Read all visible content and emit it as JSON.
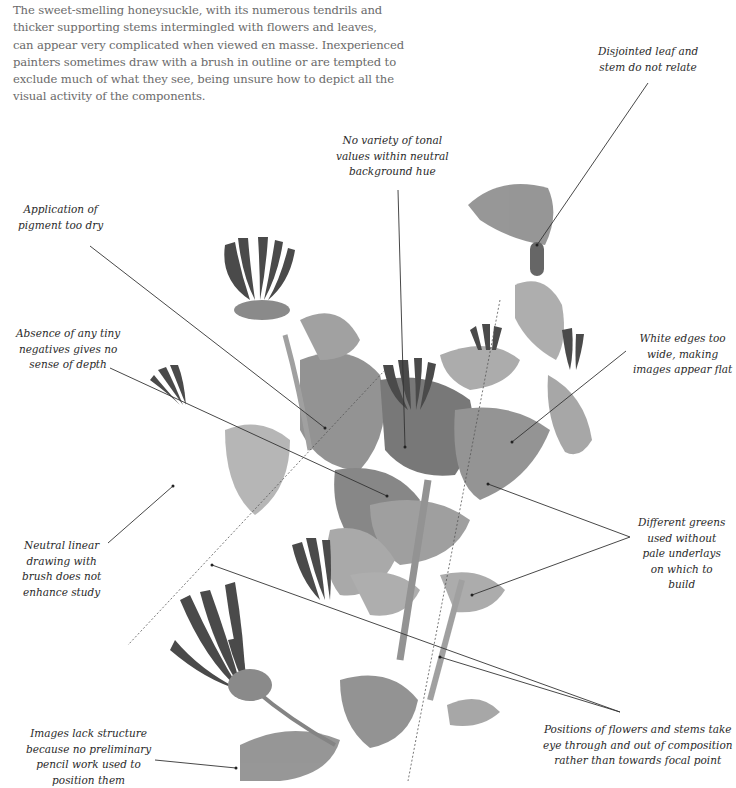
{
  "intro": {
    "lines": [
      "The sweet-smelling honeysuckle, with its numerous tendrils and",
      "thicker supporting stems intermingled with flowers and leaves,",
      "can appear very complicated when viewed en masse. Inexperienced",
      "painters sometimes draw with a brush in outline or are tempted to",
      "exclude much of what they see, being unsure how to depict all the",
      "visual activity of the components."
    ]
  },
  "illustration": {
    "subject": "honeysuckle-watercolor-study",
    "palette": {
      "dark": "#3c3c3c",
      "mid": "#6e6e6e",
      "light": "#9a9a9a",
      "pale": "#bdbdbd",
      "leader": "#333333"
    }
  },
  "annotations": [
    {
      "id": "disjointed",
      "lines": [
        "Disjointed leaf and",
        "stem do not relate"
      ]
    },
    {
      "id": "tonal",
      "lines": [
        "No variety of tonal",
        "values within neutral",
        "background hue"
      ]
    },
    {
      "id": "dry",
      "lines": [
        "Application of",
        "pigment too dry"
      ]
    },
    {
      "id": "negatives",
      "lines": [
        "Absence of any tiny",
        "negatives gives no",
        "sense of depth"
      ]
    },
    {
      "id": "white-edges",
      "lines": [
        "White edges too",
        "wide, making",
        "images appear flat"
      ]
    },
    {
      "id": "linear",
      "lines": [
        "Neutral linear",
        "drawing with",
        "brush does not",
        "enhance study"
      ]
    },
    {
      "id": "greens",
      "lines": [
        "Different greens",
        "used without",
        "pale underlays",
        "on which to",
        "build"
      ]
    },
    {
      "id": "structure",
      "lines": [
        "Images lack structure",
        "because no preliminary",
        "pencil work used to",
        "position them"
      ]
    },
    {
      "id": "positions",
      "lines": [
        "Positions of flowers and stems take",
        "eye through and out of composition",
        "rather than towards focal point"
      ]
    }
  ]
}
